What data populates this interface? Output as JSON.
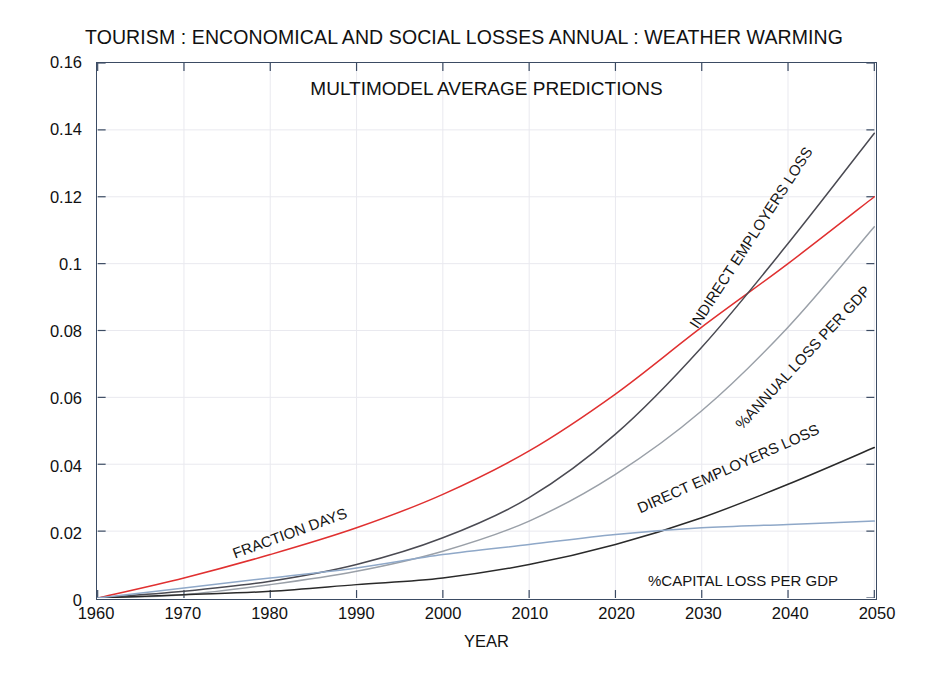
{
  "figure": {
    "title": "TOURISM : ENCONOMICAL AND SOCIAL LOSSES  ANNUAL : WEATHER WARMING",
    "subtitle": "MULTIMODEL AVERAGE PREDICTIONS"
  },
  "axes": {
    "xlabel": "YEAR",
    "ylabel": "",
    "xticks": [
      "1960",
      "1970",
      "1980",
      "1990",
      "2000",
      "2010",
      "2020",
      "2030",
      "2040",
      "2050"
    ],
    "yticks": [
      "0",
      "0.02",
      "0.04",
      "0.06",
      "0.08",
      "0.1",
      "0.12",
      "0.14",
      "0.16"
    ]
  },
  "colors": {
    "red": "#e03030",
    "dark_gray": "#4a4a52",
    "light_gray": "#9aa0a8",
    "black": "#2a2a2a",
    "light_blue": "#8fa8c8",
    "axis": "#3b4b63",
    "grid": "#e9e9ef"
  },
  "annotations": [
    {
      "text": "FRACTION DAYS",
      "x": 233,
      "y": 545,
      "rotate": -20
    },
    {
      "text": "INDIRECT EMPLOYERS LOSS",
      "x": 693,
      "y": 318,
      "rotate": -57
    },
    {
      "text": "%ANNUAL LOSS PER GDP",
      "x": 738,
      "y": 418,
      "rotate": -47
    },
    {
      "text": "DIRECT EMPLOYERS LOSS",
      "x": 638,
      "y": 500,
      "rotate": -24
    },
    {
      "text": "%CAPITAL LOSS PER GDP",
      "x": 648,
      "y": 572,
      "rotate": 0
    }
  ],
  "chart_data": {
    "type": "line",
    "title": "TOURISM : ENCONOMICAL AND SOCIAL LOSSES  ANNUAL : WEATHER WARMING",
    "subtitle": "MULTIMODEL AVERAGE PREDICTIONS",
    "xlabel": "YEAR",
    "ylabel": "",
    "xlim": [
      1960,
      2050
    ],
    "ylim": [
      0,
      0.16
    ],
    "grid": true,
    "legend": "inline-annotations",
    "x": [
      1960,
      1970,
      1980,
      1990,
      2000,
      2010,
      2020,
      2030,
      2040,
      2050
    ],
    "series": [
      {
        "name": "FRACTION DAYS",
        "color": "#e03030",
        "values": [
          0.0,
          0.006,
          0.013,
          0.021,
          0.031,
          0.044,
          0.061,
          0.081,
          0.1,
          0.12
        ]
      },
      {
        "name": "INDIRECT EMPLOYERS LOSS",
        "color": "#4a4a52",
        "values": [
          0.0,
          0.002,
          0.005,
          0.01,
          0.018,
          0.03,
          0.049,
          0.075,
          0.106,
          0.139
        ]
      },
      {
        "name": "%ANNUAL LOSS PER GDP",
        "color": "#9aa0a8",
        "values": [
          0.0,
          0.001,
          0.004,
          0.008,
          0.014,
          0.023,
          0.037,
          0.056,
          0.081,
          0.111
        ]
      },
      {
        "name": "DIRECT EMPLOYERS LOSS",
        "color": "#2a2a2a",
        "values": [
          0.0,
          0.001,
          0.002,
          0.004,
          0.006,
          0.01,
          0.016,
          0.024,
          0.034,
          0.045
        ]
      },
      {
        "name": "%CAPITAL LOSS PER GDP",
        "color": "#8fa8c8",
        "values": [
          0.0,
          0.003,
          0.006,
          0.009,
          0.013,
          0.016,
          0.019,
          0.021,
          0.022,
          0.023
        ]
      }
    ]
  }
}
